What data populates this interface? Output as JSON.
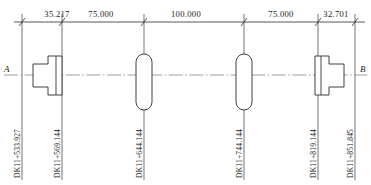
{
  "drawing": {
    "title": "Bridge span layout elevation",
    "axis_left_label": "A",
    "axis_right_label": "B",
    "line_color": "#2b2b2b",
    "centerline_color": "#7d7d7d",
    "background_color": "#ffffff"
  },
  "dimensions": [
    {
      "id": "dim-1",
      "value": "35.217",
      "x_center": 57,
      "x_start": 22,
      "x_end": 62
    },
    {
      "id": "dim-2",
      "value": "75.000",
      "x_center": 101,
      "x_start": 62,
      "x_end": 144
    },
    {
      "id": "dim-3",
      "value": "100.000",
      "x_center": 186,
      "x_start": 144,
      "x_end": 244
    },
    {
      "id": "dim-4",
      "value": "75.000",
      "x_center": 281,
      "x_start": 244,
      "x_end": 318
    },
    {
      "id": "dim-5",
      "value": "32.701",
      "x_center": 336,
      "x_start": 318,
      "x_end": 355
    }
  ],
  "stations": [
    {
      "id": "station-1",
      "label": "DK11+533.927",
      "x": 22,
      "type": "abutment-left"
    },
    {
      "id": "station-2",
      "label": "DK11+569.144",
      "x": 62,
      "type": "abutment-left-pier"
    },
    {
      "id": "station-3",
      "label": "DK11+644.144",
      "x": 144,
      "type": "pier-capsule"
    },
    {
      "id": "station-4",
      "label": "DK11+744.144",
      "x": 244,
      "type": "pier-capsule"
    },
    {
      "id": "station-5",
      "label": "DK11+819.144",
      "x": 318,
      "type": "abutment-right-pier"
    },
    {
      "id": "station-6",
      "label": "DK11+851.845",
      "x": 355,
      "type": "abutment-right"
    }
  ],
  "geometry": {
    "dim_line_y": 22,
    "centerline_y": 75,
    "station_line_top": 14,
    "station_line_bottom": 180,
    "left_abutment": {
      "x": 33,
      "y_top": 56,
      "y_bottom": 95
    },
    "right_abutment": {
      "x": 307,
      "y_top": 56,
      "y_bottom": 95
    },
    "pier_capsules": [
      {
        "cx": 144,
        "y_top": 54,
        "y_bottom": 110,
        "width": 16
      },
      {
        "cx": 244,
        "y_top": 54,
        "y_bottom": 110,
        "width": 16
      }
    ]
  }
}
